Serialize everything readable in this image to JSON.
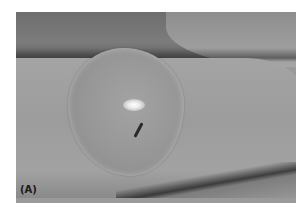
{
  "figure": {
    "panel_label": "(A)",
    "colors": {
      "background": "#ffffff",
      "skin": "#a0a0a0",
      "blister": "#969696",
      "shadow": "#4a4a4a"
    }
  }
}
